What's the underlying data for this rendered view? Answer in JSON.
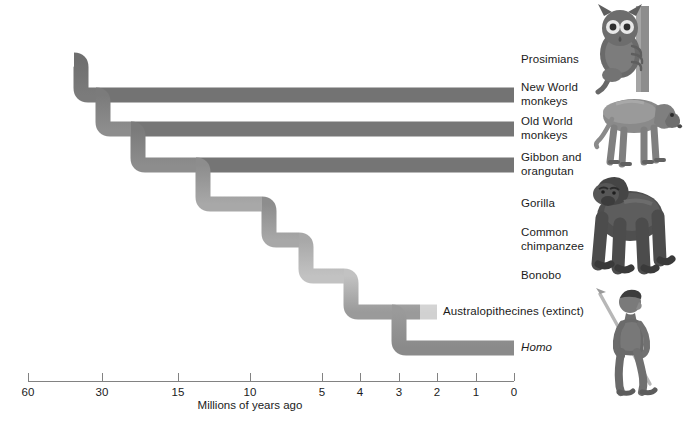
{
  "figure": {
    "type": "cladogram",
    "title": "",
    "axis": {
      "caption": "Millions of years ago",
      "caption_x": 250,
      "caption_y": 399,
      "line_y": 381,
      "line_x_start": 28,
      "line_x_end": 514,
      "ticks": [
        {
          "label": "60",
          "x": 28
        },
        {
          "label": "30",
          "x": 102
        },
        {
          "label": "15",
          "x": 178
        },
        {
          "label": "10",
          "x": 250
        },
        {
          "label": "5",
          "x": 322
        },
        {
          "label": "4",
          "x": 360
        },
        {
          "label": "3",
          "x": 399
        },
        {
          "label": "2",
          "x": 437
        },
        {
          "label": "1",
          "x": 476
        },
        {
          "label": "0",
          "x": 514
        }
      ],
      "tick_label_y": 386
    },
    "colors": {
      "branch_dark": "#6e6e6e",
      "branch_mid": "#8f8f8f",
      "branch_light": "#c9c9c9",
      "branch_pale": "#ebebeb",
      "axis": "#7a7a7a",
      "text": "#1b1b1b",
      "background": "#ffffff"
    },
    "branch_thickness": 15,
    "tips": [
      {
        "name": "prosimians",
        "label": "Prosimians",
        "y": 60,
        "label_x": 521,
        "label_y": 53,
        "italic": false,
        "shade": "dark",
        "split_x": 74,
        "tip_x": 514
      },
      {
        "name": "new-world-monkeys",
        "label": "New World\nmonkeys",
        "y": 95,
        "label_x": 521,
        "label_y": 81,
        "italic": false,
        "shade": "dark",
        "split_x": 96,
        "tip_x": 514
      },
      {
        "name": "old-world-monkeys",
        "label": "Old World\nmonkeys",
        "y": 129,
        "label_x": 521,
        "label_y": 115,
        "italic": false,
        "shade": "dark",
        "split_x": 131,
        "tip_x": 514
      },
      {
        "name": "gibbon-orangutan",
        "label": "Gibbon and\norangutan",
        "y": 165,
        "label_x": 521,
        "label_y": 151,
        "italic": false,
        "shade": "dark",
        "split_x": 196,
        "tip_x": 514
      },
      {
        "name": "gorilla",
        "label": "Gorilla",
        "y": 204,
        "label_x": 521,
        "label_y": 197,
        "italic": false,
        "shade": "light",
        "split_x": 262,
        "tip_x": 514
      },
      {
        "name": "common-chimpanzee",
        "label": "Common\nchimpanzee",
        "y": 240,
        "label_x": 521,
        "label_y": 226,
        "italic": false,
        "shade": "mid",
        "split_x": 299,
        "tip_x": 514
      },
      {
        "name": "bonobo",
        "label": "Bonobo",
        "y": 276,
        "label_x": 521,
        "label_y": 269,
        "italic": false,
        "shade": "pale",
        "split_x": 344,
        "tip_x": 514
      },
      {
        "name": "australopithecines",
        "label": "Australopithecines (extinct)",
        "y": 312,
        "label_x": 443,
        "label_y": 305,
        "italic": false,
        "shade": "light",
        "tip_x": 437
      },
      {
        "name": "homo",
        "label": "Homo",
        "y": 348,
        "label_x": 521,
        "label_y": 341,
        "italic": true,
        "shade": "mid",
        "tip_x": 514
      }
    ],
    "root": {
      "x": 28,
      "y": 60
    },
    "nodes": [
      {
        "name": "primates-root",
        "x": 74,
        "time_mya": 48
      },
      {
        "name": "anthropoid-split",
        "x": 96,
        "time_mya": 40
      },
      {
        "name": "catarrhine-split",
        "x": 131,
        "time_mya": 26
      },
      {
        "name": "hominoid-split",
        "x": 196,
        "time_mya": 16
      },
      {
        "name": "gorilla-split",
        "x": 262,
        "time_mya": 9
      },
      {
        "name": "pan-homo-split",
        "x": 299,
        "time_mya": 7
      },
      {
        "name": "bonobo-chimp-split",
        "x": 344,
        "time_mya": 4
      },
      {
        "name": "homo-australo-split",
        "x": 392,
        "time_mya": 3
      }
    ],
    "images": [
      {
        "name": "tarsier-illustration",
        "alt": "tarsier clinging to branch",
        "x": 592,
        "y": 6,
        "w": 74,
        "h": 86
      },
      {
        "name": "baboon-illustration",
        "alt": "baboon standing",
        "x": 586,
        "y": 86,
        "w": 92,
        "h": 78
      },
      {
        "name": "gorilla-illustration",
        "alt": "gorilla on knuckles",
        "x": 580,
        "y": 172,
        "w": 96,
        "h": 104
      },
      {
        "name": "hominid-illustration",
        "alt": "early human holding spear",
        "x": 594,
        "y": 288,
        "w": 66,
        "h": 106
      }
    ]
  }
}
